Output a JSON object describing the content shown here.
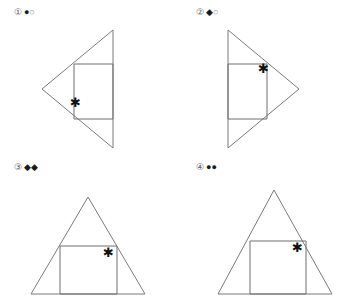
{
  "page": {
    "background_color": "#ffffff",
    "line_color": "#6f6f6f",
    "mark_glyph": "*"
  },
  "panels": [
    {
      "id": "panel-1",
      "index_label": "①",
      "marks": [
        "●",
        "○"
      ],
      "shape_name": "left-pointing-triangle-with-rectangle",
      "asterisk": "✱",
      "triangle_points": "113,30 113,148 42,89",
      "rectangle_points": "74,64 113,64 113,119 74,119"
    },
    {
      "id": "panel-2",
      "index_label": "②",
      "marks": [
        "◆",
        "○"
      ],
      "shape_name": "right-pointing-triangle-with-rectangle",
      "asterisk": "✱",
      "triangle_points": "46,30 46,148 117,89",
      "rectangle_points": "46,64 85,64 85,119 46,119"
    },
    {
      "id": "panel-3",
      "index_label": "③",
      "marks": [
        "◆",
        "◆"
      ],
      "shape_name": "upward-triangle-with-centered-rectangle",
      "asterisk": "✱",
      "triangle_points": "88,42 31,139 145,139",
      "rectangle_points": "60,91 117,91 117,139 60,139"
    },
    {
      "id": "panel-4",
      "index_label": "④",
      "marks": [
        "●",
        "●"
      ],
      "shape_name": "upward-triangle-with-offset-rectangle",
      "asterisk": "✱",
      "triangle_points": "92,35 36,139 150,139",
      "rectangle_points": "68,86 124,86 124,139 68,139"
    }
  ]
}
